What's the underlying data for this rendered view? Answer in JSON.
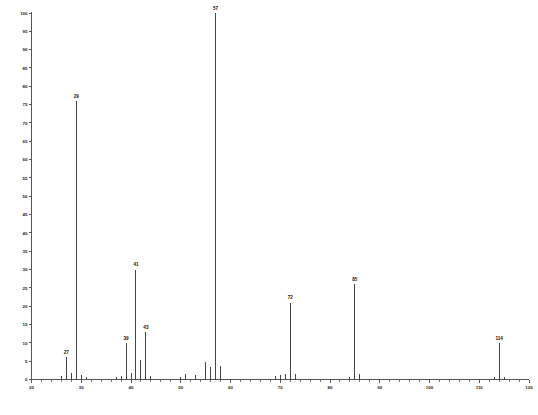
{
  "chart_data": {
    "type": "bar",
    "title": "",
    "subtitle": "",
    "xlabel": "",
    "ylabel": "",
    "xlim": [
      20,
      120
    ],
    "ylim": [
      0,
      100
    ],
    "grid": false,
    "legend": null,
    "x_ticks": [
      20,
      30,
      40,
      50,
      60,
      70,
      80,
      90,
      100,
      110,
      120
    ],
    "x_tick_labels": [
      "20",
      "30",
      "40",
      "50",
      "60",
      "70",
      "80",
      "90",
      "100",
      "110",
      "120"
    ],
    "x_minor_tick_step": 2,
    "y_ticks": [
      0,
      5,
      10,
      15,
      20,
      25,
      30,
      35,
      40,
      45,
      50,
      55,
      60,
      65,
      70,
      75,
      80,
      85,
      90,
      95,
      100
    ],
    "y_tick_labels": [
      "0",
      "5",
      "10",
      "15",
      "20",
      "25",
      "30",
      "35",
      "40",
      "45",
      "50",
      "55",
      "60",
      "65",
      "70",
      "75",
      "80",
      "85",
      "90",
      "95",
      "100"
    ],
    "series_name": "relative-intensity",
    "categories": [
      26,
      27,
      28,
      29,
      30,
      31,
      37,
      38,
      39,
      40,
      41,
      42,
      43,
      44,
      50,
      51,
      53,
      55,
      56,
      57,
      58,
      69,
      70,
      71,
      72,
      73,
      84,
      85,
      86,
      113,
      114,
      115
    ],
    "values": [
      1.0,
      6.2,
      1.8,
      76.0,
      1.2,
      0.8,
      0.6,
      0.9,
      10.0,
      1.8,
      30.0,
      5.2,
      13.0,
      1.0,
      0.7,
      1.6,
      1.1,
      4.8,
      3.4,
      100.0,
      3.8,
      0.9,
      1.2,
      1.6,
      21.0,
      1.4,
      0.8,
      26.0,
      1.5,
      0.6,
      10.0,
      0.8
    ],
    "labeled_peaks": [
      {
        "mz": 27,
        "intensity": 6.2,
        "label": "27"
      },
      {
        "mz": 29,
        "intensity": 76.0,
        "label": "29"
      },
      {
        "mz": 39,
        "intensity": 10.0,
        "label": "39"
      },
      {
        "mz": 41,
        "intensity": 30.0,
        "label": "41"
      },
      {
        "mz": 43,
        "intensity": 13.0,
        "label": "43"
      },
      {
        "mz": 57,
        "intensity": 100.0,
        "label": "57"
      },
      {
        "mz": 72,
        "intensity": 21.0,
        "label": "72"
      },
      {
        "mz": 85,
        "intensity": 26.0,
        "label": "85"
      },
      {
        "mz": 114,
        "intensity": 10.0,
        "label": "114"
      }
    ],
    "colors": {
      "peak": "#444444",
      "axis": "#555555",
      "text": "#111111",
      "background": "#ffffff"
    }
  }
}
